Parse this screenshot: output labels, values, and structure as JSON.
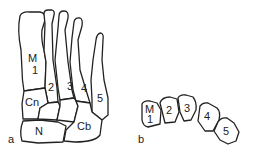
{
  "panel_a": {
    "label": "a",
    "bones": {
      "m1_top": "M",
      "m1_bottom": "1",
      "m2": "2",
      "m3": "3",
      "m4": "4",
      "m5": "5",
      "cuneiform": "Cn",
      "navicular": "N",
      "cuboid": "Cb"
    }
  },
  "panel_b": {
    "label": "b",
    "bones": {
      "m1_top": "M",
      "m1_bottom": "1",
      "m2": "2",
      "m3": "3",
      "m4": "4",
      "m5": "5"
    }
  }
}
